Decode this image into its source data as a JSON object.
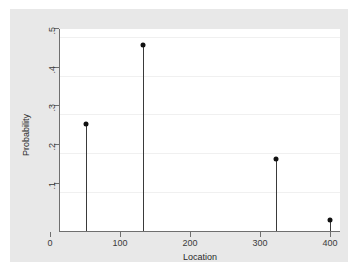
{
  "chart_data": {
    "type": "scatter",
    "title": "",
    "xlabel": "Location",
    "ylabel": "Probability",
    "xlim": [
      0,
      400
    ],
    "ylim": [
      0,
      0.52
    ],
    "grid": true,
    "legend": null,
    "x_ticks": [
      0,
      100,
      200,
      300,
      400
    ],
    "x_tick_labels": [
      "0",
      "100",
      "200",
      "300",
      "400"
    ],
    "y_ticks": [
      0.1,
      0.2,
      0.3,
      0.4,
      0.5
    ],
    "y_tick_labels": [
      ".1",
      ".2",
      ".3",
      ".4",
      ".5"
    ],
    "marker_style": "filled-circle",
    "stems": true,
    "series": [
      {
        "name": "Probability",
        "points": [
          {
            "x": 37,
            "y": 0.275
          },
          {
            "x": 118,
            "y": 0.478
          },
          {
            "x": 308,
            "y": 0.185
          },
          {
            "x": 385,
            "y": 0.028
          }
        ]
      }
    ],
    "colors": {
      "marker": "#111111",
      "stem": "#3a3a3a",
      "axis": "#6f6f6f",
      "gridline": "#f0f0f0",
      "plot_background": "#ffffff",
      "graph_background": "#e8e8e8",
      "page_background": "#ffffff",
      "text": "#2a2a2a"
    }
  }
}
